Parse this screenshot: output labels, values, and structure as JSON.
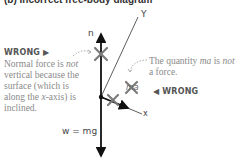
{
  "caption": "(b) Incorrect free-body diagram",
  "axes": {
    "y_label": "Y",
    "x_label": "x"
  },
  "forces": {
    "normal_label": "n",
    "weight_label": "w = mg",
    "ma_label": "ma"
  },
  "annotations": {
    "wrong_left": "WRONG ▶",
    "wrong_right": "◀ WRONG",
    "normal_note_1": "Normal force is ",
    "normal_note_em": "not",
    "normal_note_2": " vertical because the surface (which is along the ",
    "normal_note_em2": "x",
    "normal_note_3": "-axis) is inclined.",
    "ma_note_1": "The quantity ",
    "ma_note_em": "ma",
    "ma_note_2": " is ",
    "ma_note_em2": "not",
    "ma_note_3": " a force."
  },
  "colors": {
    "ink": "#111111",
    "cross": "#7a7a7a",
    "note": "#8a8a8a",
    "wrong": "#555555"
  }
}
